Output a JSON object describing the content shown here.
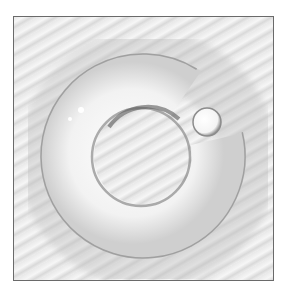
{
  "image": {
    "subject": "captive bead ring",
    "description": "Grayscale photo of a ring with a small ball bead closing the gap, on a textured striped background, inside a thin gray frame",
    "colors": {
      "frame_border": "#6a6a6a",
      "background_light": "#f2f2f2",
      "background_dark": "#d8d8d8",
      "ring_highlight": "#ffffff",
      "ring_shadow": "#9a9a9a"
    }
  }
}
